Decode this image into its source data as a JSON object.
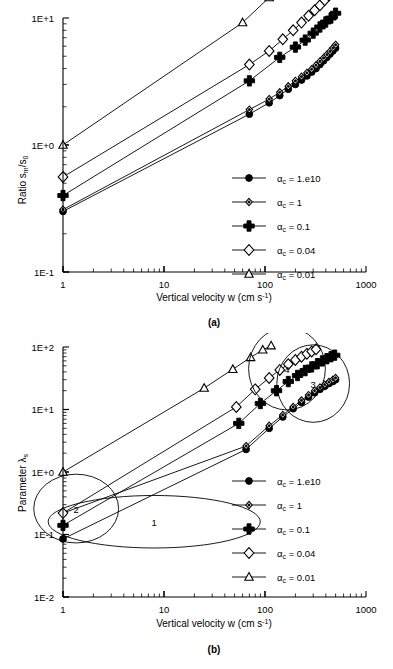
{
  "figure": {
    "panels": [
      {
        "id": "a",
        "caption": "(a)",
        "ylabel_main": "Ratio s",
        "ylabel_sub1": "m",
        "ylabel_mid": "/s",
        "ylabel_sub2": "0",
        "xlabel_main": "Vertical velocity w (cm s",
        "xlabel_sup": "-1",
        "xlabel_end": ")"
      },
      {
        "id": "b",
        "caption": "(b)",
        "ylabel_main": "Parameter λ",
        "ylabel_sub1": "s",
        "xlabel_main": "Vertical velocity w (cm s",
        "xlabel_sup": "-1",
        "xlabel_end": ")"
      }
    ],
    "legend": {
      "items": [
        {
          "marker": "filled-circle",
          "label_prefix": "α",
          "label_sub": "c",
          "label_value": " = 1.e10"
        },
        {
          "marker": "small-open-diamond",
          "label_prefix": "α",
          "label_sub": "c",
          "label_value": " = 1"
        },
        {
          "marker": "plus",
          "label_prefix": "α",
          "label_sub": "c",
          "label_value": " = 0.1"
        },
        {
          "marker": "large-open-diamond",
          "label_prefix": "α",
          "label_sub": "c",
          "label_value": " = 0.04"
        },
        {
          "marker": "open-triangle",
          "label_prefix": "α",
          "label_sub": "c",
          "label_value": " = 0.01"
        }
      ]
    },
    "annotations_b": [
      {
        "id": "1",
        "label": "1"
      },
      {
        "id": "2",
        "label": "2"
      },
      {
        "id": "3",
        "label": "3"
      },
      {
        "id": "4",
        "label": "4"
      }
    ]
  },
  "chart_data": [
    {
      "type": "line",
      "panel": "a",
      "title": "",
      "xlabel": "Vertical velocity w (cm s-1)",
      "ylabel": "Ratio sm/s0",
      "xscale": "log",
      "yscale": "log",
      "xlim": [
        1,
        1000
      ],
      "ylim": [
        0.1,
        10
      ],
      "xticks": [
        1,
        10,
        100,
        1000
      ],
      "xticklabels": [
        "1",
        "10",
        "100",
        "1000"
      ],
      "yticks": [
        0.1,
        1,
        10
      ],
      "yticklabels": [
        "1E-1",
        "1E+0",
        "1E+1"
      ],
      "grid": false,
      "legend_position": "lower-right-inside",
      "series": [
        {
          "name": "ac = 1.e10",
          "marker": "filled-circle",
          "x": [
            1,
            70,
            110,
            140,
            170,
            200,
            230,
            260,
            290,
            320,
            350,
            380,
            410,
            440,
            470,
            500
          ],
          "y": [
            0.3,
            1.75,
            2.15,
            2.45,
            2.75,
            3.0,
            3.25,
            3.5,
            3.75,
            4.0,
            4.3,
            4.6,
            4.9,
            5.2,
            5.5,
            5.8
          ]
        },
        {
          "name": "ac = 1",
          "marker": "small-open-diamond",
          "x": [
            1,
            70,
            110,
            140,
            170,
            200,
            230,
            260,
            290,
            320,
            350,
            380,
            410,
            440,
            470,
            500
          ],
          "y": [
            0.31,
            1.9,
            2.3,
            2.6,
            2.9,
            3.2,
            3.45,
            3.7,
            3.95,
            4.25,
            4.55,
            4.85,
            5.15,
            5.45,
            5.8,
            6.15
          ]
        },
        {
          "name": "ac = 0.1",
          "marker": "plus",
          "x": [
            1,
            70,
            140,
            200,
            250,
            300,
            350,
            400,
            450,
            500
          ],
          "y": [
            0.4,
            3.2,
            4.9,
            5.9,
            6.7,
            7.6,
            8.5,
            9.3,
            10.0,
            10.9
          ]
        },
        {
          "name": "ac = 0.04",
          "marker": "large-open-diamond",
          "x": [
            1,
            70,
            110,
            150,
            190,
            230,
            270,
            310,
            350,
            390,
            430,
            470,
            500
          ],
          "y": [
            0.56,
            4.3,
            5.5,
            6.8,
            8.0,
            9.2,
            10.4,
            11.5,
            12.6,
            13.8,
            15.0,
            16.2,
            17.0
          ]
        },
        {
          "name": "ac = 0.01",
          "marker": "open-triangle",
          "x": [
            1,
            60,
            110,
            160,
            210,
            260,
            310,
            360,
            410
          ],
          "y": [
            1.0,
            9.2,
            14.5,
            19.0,
            23.0,
            27.0,
            31.0,
            35.0,
            39.0
          ]
        }
      ]
    },
    {
      "type": "line",
      "panel": "b",
      "title": "",
      "xlabel": "Vertical velocity w (cm s-1)",
      "ylabel": "Parameter λs",
      "xscale": "log",
      "yscale": "log",
      "xlim": [
        1,
        1000
      ],
      "ylim": [
        0.01,
        100
      ],
      "xticks": [
        1,
        10,
        100,
        1000
      ],
      "xticklabels": [
        "1",
        "10",
        "100",
        "1000"
      ],
      "yticks": [
        0.01,
        0.1,
        1,
        10,
        100
      ],
      "yticklabels": [
        "1E-2",
        "1E-1",
        "1E+0",
        "1E+1",
        "1E+2"
      ],
      "grid": false,
      "legend_position": "lower-right-inside",
      "series": [
        {
          "name": "ac = 1.e10",
          "marker": "filled-circle",
          "x": [
            1,
            65,
            110,
            150,
            190,
            230,
            270,
            310,
            350,
            390,
            430,
            470,
            500
          ],
          "y": [
            0.085,
            2.3,
            5.0,
            7.6,
            10.3,
            13.0,
            15.8,
            18.5,
            21.0,
            23.5,
            26.0,
            28.0,
            30.0
          ]
        },
        {
          "name": "ac = 1",
          "marker": "small-open-diamond",
          "x": [
            1,
            65,
            110,
            150,
            190,
            230,
            270,
            310,
            350,
            390,
            430,
            470,
            500
          ],
          "y": [
            0.22,
            2.6,
            5.5,
            8.2,
            11.0,
            14.0,
            17.0,
            20.0,
            22.5,
            25.0,
            27.5,
            30.0,
            32.0
          ]
        },
        {
          "name": "ac = 0.1",
          "marker": "plus",
          "x": [
            1,
            55,
            90,
            130,
            170,
            210,
            250,
            290,
            330,
            370,
            410,
            450,
            490
          ],
          "y": [
            0.14,
            6.0,
            12.5,
            20.0,
            28.0,
            35.0,
            42.0,
            48.0,
            54.0,
            60.0,
            65.0,
            70.0,
            74.0
          ]
        },
        {
          "name": "ac = 0.04",
          "marker": "large-open-diamond",
          "x": [
            1,
            52,
            80,
            110,
            140,
            170,
            200,
            230,
            260,
            290,
            320
          ],
          "y": [
            0.22,
            11.0,
            21.0,
            32.0,
            43.0,
            53.0,
            62.0,
            70.0,
            78.0,
            85.0,
            92.0
          ]
        },
        {
          "name": "ac = 0.01",
          "marker": "open-triangle",
          "x": [
            1,
            25,
            48,
            72,
            95,
            115
          ],
          "y": [
            1.0,
            22.0,
            44.0,
            68.0,
            90.0,
            105.0
          ]
        }
      ],
      "annotations": [
        {
          "label": "1",
          "cx": 8.0,
          "cy": 0.16,
          "rx_decades": 1.05,
          "ry_decades": 0.42
        },
        {
          "label": "2",
          "cx": 1.35,
          "cy": 0.26,
          "rx_decades": 0.42,
          "ry_decades": 0.55
        },
        {
          "label": "3",
          "cx": 300,
          "cy": 26.0,
          "rx_decades": 0.36,
          "ry_decades": 0.62
        },
        {
          "label": "4",
          "cx": 165,
          "cy": 45.0,
          "rx_decades": 0.38,
          "ry_decades": 0.66
        }
      ]
    }
  ]
}
